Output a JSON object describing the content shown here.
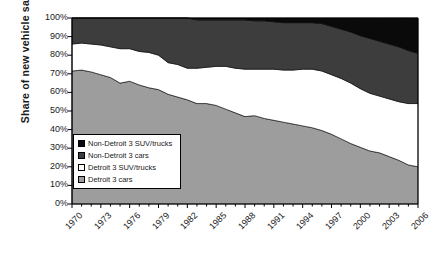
{
  "chart_data": {
    "type": "area",
    "title": "",
    "subtitle": "",
    "xlabel": "",
    "ylabel": "Share of new vehicle sales",
    "stacked": true,
    "stack_order": "bottom-to-top",
    "grid": false,
    "legend_position": "inside-lower-left",
    "xlim": [
      1970,
      2006
    ],
    "ylim": [
      0,
      100
    ],
    "y_tick_labels": [
      "0%",
      "10%",
      "20%",
      "30%",
      "40%",
      "50%",
      "60%",
      "70%",
      "80%",
      "90%",
      "100%"
    ],
    "y_tick_values": [
      0,
      10,
      20,
      30,
      40,
      50,
      60,
      70,
      80,
      90,
      100
    ],
    "x_tick_labels": [
      "1970",
      "1973",
      "1976",
      "1979",
      "1982",
      "1985",
      "1988",
      "1991",
      "1994",
      "1997",
      "2000",
      "2003",
      "2006"
    ],
    "x_tick_values": [
      1970,
      1973,
      1976,
      1979,
      1982,
      1985,
      1988,
      1991,
      1994,
      1997,
      2000,
      2003,
      2006
    ],
    "x": [
      1970,
      1971,
      1972,
      1973,
      1974,
      1975,
      1976,
      1977,
      1978,
      1979,
      1980,
      1981,
      1982,
      1983,
      1984,
      1985,
      1986,
      1987,
      1988,
      1989,
      1990,
      1991,
      1992,
      1993,
      1994,
      1995,
      1996,
      1997,
      1998,
      1999,
      2000,
      2001,
      2002,
      2003,
      2004,
      2005,
      2006
    ],
    "series": [
      {
        "name": "Detroit 3 cars",
        "color": "#9d9d9d",
        "values": [
          71.5,
          72.0,
          71.0,
          69.5,
          68.0,
          65.0,
          66.0,
          64.0,
          62.5,
          61.5,
          59.0,
          57.5,
          56.0,
          54.0,
          54.0,
          53.0,
          51.0,
          49.0,
          47.0,
          47.5,
          46.0,
          45.0,
          44.0,
          43.0,
          42.0,
          41.0,
          39.5,
          37.5,
          35.0,
          32.5,
          30.5,
          28.5,
          27.5,
          25.5,
          23.5,
          21.0,
          20.0
        ]
      },
      {
        "name": "Detroit 3 SUV/trucks",
        "color": "#ffffff",
        "values": [
          14.5,
          14.5,
          15.0,
          16.0,
          16.5,
          18.5,
          17.5,
          18.0,
          19.0,
          18.5,
          17.0,
          17.5,
          17.0,
          19.0,
          19.5,
          21.0,
          23.0,
          24.0,
          25.5,
          25.0,
          26.5,
          27.5,
          28.0,
          29.0,
          30.5,
          31.5,
          32.0,
          32.0,
          32.5,
          32.5,
          31.5,
          31.0,
          30.5,
          31.0,
          31.5,
          33.0,
          34.0
        ]
      },
      {
        "name": "Non-Detroit 3 cars",
        "color": "#3d3d3d",
        "values": [
          14.0,
          13.5,
          14.0,
          14.5,
          15.5,
          16.5,
          16.5,
          18.0,
          18.5,
          20.0,
          24.0,
          25.0,
          27.0,
          26.0,
          25.5,
          25.0,
          25.0,
          26.0,
          26.5,
          26.0,
          26.0,
          25.5,
          25.5,
          25.5,
          25.0,
          25.0,
          25.5,
          26.0,
          26.5,
          27.5,
          28.5,
          29.5,
          29.5,
          29.5,
          29.5,
          28.5,
          27.0
        ]
      },
      {
        "name": "Non-Detroit 3 SUV/trucks",
        "color": "#0a0a0a",
        "values": [
          0.0,
          0.0,
          0.0,
          0.0,
          0.0,
          0.0,
          0.0,
          0.0,
          0.0,
          0.0,
          0.0,
          0.0,
          0.0,
          1.0,
          1.0,
          1.0,
          1.0,
          1.0,
          1.0,
          1.5,
          1.5,
          2.0,
          2.5,
          2.5,
          2.5,
          2.5,
          3.0,
          4.5,
          6.0,
          7.5,
          9.5,
          11.0,
          12.5,
          14.0,
          15.5,
          17.5,
          19.0
        ]
      }
    ]
  },
  "legend": {
    "entries": [
      {
        "label": "Non-Detroit 3 SUV/trucks",
        "color": "#0a0a0a"
      },
      {
        "label": "Non-Detroit 3 cars",
        "color": "#3d3d3d"
      },
      {
        "label": "Detroit 3 SUV/trucks",
        "color": "#ffffff"
      },
      {
        "label": "Detroit 3 cars",
        "color": "#9d9d9d"
      }
    ]
  },
  "axis": {
    "y_title": "Share of new vehicle sales"
  }
}
